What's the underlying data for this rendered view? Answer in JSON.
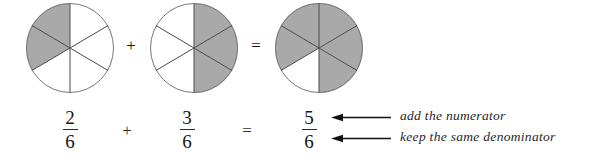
{
  "figure": {
    "colors": {
      "shaded": "#a9a9a9",
      "unshaded": "#ffffff",
      "outline": "#6f6f6f",
      "divider": "#4a4a4a",
      "text": "#1a1a1a",
      "arrow": "#111111",
      "background": "#ffffff"
    },
    "sectors_total": 6
  },
  "diagram": {
    "pies": [
      {
        "name": "first-addend-pie",
        "total_sectors": 6,
        "shaded_sectors": 2,
        "shaded_indices": [
          2,
          3
        ],
        "label": "2 of 6 shaded"
      },
      {
        "name": "second-addend-pie",
        "total_sectors": 6,
        "shaded_sectors": 3,
        "shaded_indices": [
          0,
          1,
          5
        ],
        "label": "3 of 6 shaded"
      },
      {
        "name": "sum-pie",
        "total_sectors": 6,
        "shaded_sectors": 5,
        "shaded_indices": [
          0,
          1,
          2,
          5,
          4
        ],
        "label": "5 of 6 shaded"
      }
    ],
    "operators": [
      {
        "name": "plus-sign-diagram",
        "symbol": "+"
      },
      {
        "name": "equals-sign-diagram",
        "symbol": "="
      }
    ]
  },
  "equation": {
    "fractions": [
      {
        "name": "first-fraction",
        "numerator": "2",
        "denominator": "6"
      },
      {
        "name": "second-fraction",
        "numerator": "3",
        "denominator": "6"
      },
      {
        "name": "result-fraction",
        "numerator": "5",
        "denominator": "6"
      }
    ],
    "operators": [
      {
        "name": "plus-sign-equation",
        "symbol": "+"
      },
      {
        "name": "equals-sign-equation",
        "symbol": "="
      }
    ]
  },
  "annotations": [
    {
      "name": "numerator-annotation",
      "text": "add the numerator",
      "points_to": "result-numerator"
    },
    {
      "name": "denominator-annotation",
      "text": "keep the same denominator",
      "points_to": "result-denominator"
    }
  ]
}
